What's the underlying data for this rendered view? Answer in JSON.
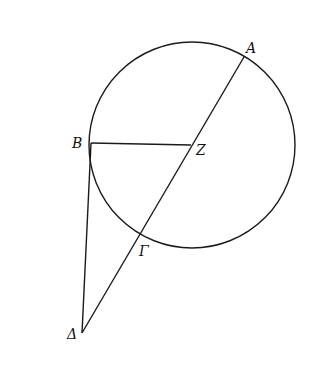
{
  "diagram": {
    "type": "geometry",
    "circle": {
      "cx": 192,
      "cy": 145,
      "r": 103
    },
    "points": {
      "A": {
        "x": 244,
        "y": 57,
        "label": "A",
        "lx": 246,
        "ly": 53
      },
      "B": {
        "x": 91,
        "y": 143,
        "label": "B",
        "lx": 72,
        "ly": 148
      },
      "Z": {
        "x": 191,
        "y": 145,
        "label": "Z",
        "lx": 196,
        "ly": 155
      },
      "Gamma": {
        "x": 142,
        "y": 233,
        "label": "Γ",
        "lx": 139,
        "ly": 256
      },
      "Delta": {
        "x": 82,
        "y": 333,
        "label": "Δ",
        "lx": 67,
        "ly": 339
      }
    },
    "segments": [
      {
        "name": "segment-BZ",
        "from": "B",
        "to": "Z"
      },
      {
        "name": "segment-A-Delta",
        "from": "A",
        "to": "Delta"
      },
      {
        "name": "segment-B-Delta",
        "from": "B",
        "to": "Delta"
      }
    ]
  }
}
